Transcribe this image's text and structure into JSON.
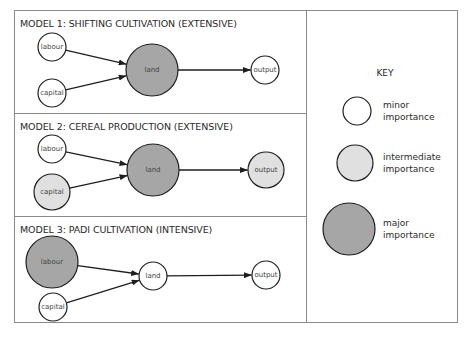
{
  "colors": {
    "minor": "#ffffff",
    "intermediate": "#e0e0e0",
    "major": "#a6a6a6",
    "stroke": "#1e1e1e",
    "frame": "#8a8a8a"
  },
  "radii": {
    "minor": 14,
    "intermediate": 18,
    "major": 26
  },
  "models": [
    {
      "title": "MODEL 1: SHIFTING CULTIVATION (EXTENSIVE)",
      "nodes": {
        "labour": {
          "label": "labour",
          "importance": "minor",
          "cx": 52,
          "cy": 47
        },
        "capital": {
          "label": "capital",
          "importance": "minor",
          "cx": 52,
          "cy": 93
        },
        "land": {
          "label": "land",
          "importance": "major",
          "cx": 152,
          "cy": 70
        },
        "output": {
          "label": "output",
          "importance": "minor",
          "cx": 265,
          "cy": 70
        }
      },
      "edges": [
        [
          "labour",
          "land"
        ],
        [
          "capital",
          "land"
        ],
        [
          "land",
          "output"
        ]
      ]
    },
    {
      "title": "MODEL 2: CEREAL PRODUCTION (EXTENSIVE)",
      "nodes": {
        "labour": {
          "label": "labour",
          "importance": "minor",
          "cx": 52,
          "cy": 149
        },
        "capital": {
          "label": "capital",
          "importance": "intermediate",
          "cx": 52,
          "cy": 192
        },
        "land": {
          "label": "land",
          "importance": "major",
          "cx": 153,
          "cy": 170
        },
        "output": {
          "label": "output",
          "importance": "intermediate",
          "cx": 266,
          "cy": 170
        }
      },
      "edges": [
        [
          "labour",
          "land"
        ],
        [
          "capital",
          "land"
        ],
        [
          "land",
          "output"
        ]
      ]
    },
    {
      "title": "MODEL 3: PADI CULTIVATION (INTENSIVE)",
      "nodes": {
        "labour": {
          "label": "labour",
          "importance": "major",
          "cx": 52,
          "cy": 262
        },
        "capital": {
          "label": "capital",
          "importance": "minor",
          "cx": 53,
          "cy": 307
        },
        "land": {
          "label": "land",
          "importance": "minor",
          "cx": 153,
          "cy": 276
        },
        "output": {
          "label": "output",
          "importance": "minor",
          "cx": 266,
          "cy": 275
        }
      },
      "edges": [
        [
          "labour",
          "land"
        ],
        [
          "capital",
          "land"
        ],
        [
          "land",
          "output"
        ]
      ]
    }
  ],
  "key": {
    "title": "KEY",
    "items": [
      {
        "importance": "minor",
        "line1": "minor",
        "line2": "importance",
        "cx": 357,
        "cy": 111
      },
      {
        "importance": "intermediate",
        "line1": "intermediate",
        "line2": "importance",
        "cx": 355,
        "cy": 163
      },
      {
        "importance": "major",
        "line1": "major",
        "line2": "importance",
        "cx": 349,
        "cy": 229
      }
    ]
  }
}
